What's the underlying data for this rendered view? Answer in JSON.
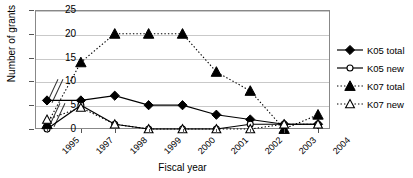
{
  "chart_data": {
    "type": "line",
    "title": "Research 1995-2004",
    "xlabel": "Fiscal year",
    "ylabel": "Number of grants",
    "categories": [
      "1995",
      "1997",
      "1998",
      "1999",
      "2000",
      "2001",
      "2002",
      "2003",
      "2004"
    ],
    "ylim": [
      0,
      25
    ],
    "yticks": [
      0,
      5,
      10,
      15,
      20,
      25
    ],
    "grid": true,
    "legend_position": "right",
    "axis_break": "between 1995 and 1997",
    "series": [
      {
        "name": "K05 total",
        "marker": "filled-diamond",
        "line": "solid",
        "color": "#000000",
        "values": [
          6,
          6,
          7,
          5,
          5,
          3,
          2,
          1,
          1
        ]
      },
      {
        "name": "K05 new",
        "marker": "open-circle",
        "line": "solid",
        "color": "#000000",
        "values": [
          0,
          5,
          1,
          0,
          0,
          0,
          1,
          1,
          1
        ]
      },
      {
        "name": "K07 total",
        "marker": "filled-triangle",
        "line": "dotted",
        "color": "#000000",
        "values": [
          1,
          14,
          20,
          20,
          20,
          12,
          8,
          0,
          3
        ]
      },
      {
        "name": "K07 new",
        "marker": "open-triangle",
        "line": "dotted",
        "color": "#000000",
        "values": [
          2,
          4.5,
          1,
          0,
          0,
          0,
          0,
          1,
          1
        ]
      }
    ]
  }
}
